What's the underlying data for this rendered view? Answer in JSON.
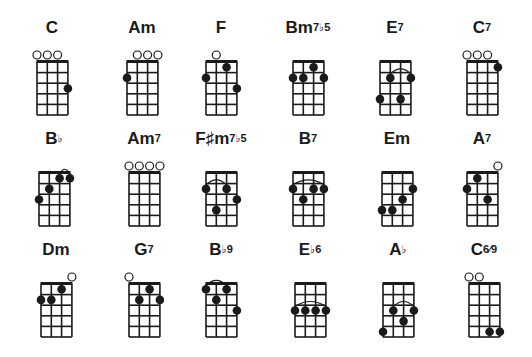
{
  "layout": {
    "strings": 4,
    "frets": 5
  },
  "chords": [
    {
      "name": "C",
      "sup": "",
      "x": 37,
      "y": 62,
      "open": [
        0,
        1,
        2
      ],
      "dots": [
        {
          "s": 3,
          "f": 3
        }
      ],
      "arcs": []
    },
    {
      "name": "Am",
      "sup": "",
      "x": 127,
      "y": 62,
      "open": [
        1,
        2,
        3
      ],
      "dots": [
        {
          "s": 0,
          "f": 2
        }
      ],
      "arcs": []
    },
    {
      "name": "F",
      "sup": "",
      "x": 206,
      "y": 62,
      "open": [
        1
      ],
      "dots": [
        {
          "s": 0,
          "f": 2
        },
        {
          "s": 2,
          "f": 1
        },
        {
          "s": 3,
          "f": 3
        }
      ],
      "arcs": []
    },
    {
      "name": "Bm",
      "sup": "7♭5",
      "x": 293,
      "y": 62,
      "open": [],
      "dots": [
        {
          "s": 0,
          "f": 2
        },
        {
          "s": 1,
          "f": 2
        },
        {
          "s": 2,
          "f": 1
        },
        {
          "s": 3,
          "f": 2
        }
      ],
      "arcs": []
    },
    {
      "name": "E",
      "sup": "7",
      "x": 380,
      "y": 62,
      "open": [],
      "dots": [
        {
          "s": 1,
          "f": 2
        },
        {
          "s": 3,
          "f": 2
        },
        {
          "s": 0,
          "f": 4
        },
        {
          "s": 2,
          "f": 4
        }
      ],
      "arcs": [
        {
          "from": 1,
          "to": 3,
          "f": 2
        }
      ]
    },
    {
      "name": "C",
      "sup": "7",
      "x": 467,
      "y": 62,
      "open": [
        0,
        1,
        2
      ],
      "dots": [
        {
          "s": 3,
          "f": 1
        }
      ],
      "arcs": []
    },
    {
      "name": "B",
      "sup": "♭",
      "x": 39,
      "y": 173,
      "open": [],
      "dots": [
        {
          "s": 0,
          "f": 3
        },
        {
          "s": 1,
          "f": 2
        },
        {
          "s": 2,
          "f": 1
        },
        {
          "s": 3,
          "f": 1
        }
      ],
      "arcs": [
        {
          "from": 2,
          "to": 3,
          "f": 1
        }
      ]
    },
    {
      "name": "Am",
      "sup": "7",
      "x": 129,
      "y": 173,
      "open": [
        0,
        1,
        2,
        3
      ],
      "dots": [],
      "arcs": []
    },
    {
      "name": "F♯m",
      "sup": "7♭5",
      "x": 206,
      "y": 173,
      "open": [],
      "dots": [
        {
          "s": 0,
          "f": 2
        },
        {
          "s": 2,
          "f": 2
        },
        {
          "s": 3,
          "f": 3
        },
        {
          "s": 1,
          "f": 4
        }
      ],
      "arcs": [
        {
          "from": 0,
          "to": 2,
          "f": 2
        }
      ]
    },
    {
      "name": "B",
      "sup": "7",
      "x": 293,
      "y": 173,
      "open": [],
      "dots": [
        {
          "s": 0,
          "f": 2
        },
        {
          "s": 2,
          "f": 2
        },
        {
          "s": 3,
          "f": 2
        },
        {
          "s": 1,
          "f": 3
        }
      ],
      "arcs": [
        {
          "from": 0,
          "to": 3,
          "f": 2
        }
      ]
    },
    {
      "name": "Em",
      "sup": "",
      "x": 382,
      "y": 173,
      "open": [],
      "dots": [
        {
          "s": 3,
          "f": 2
        },
        {
          "s": 2,
          "f": 3
        },
        {
          "s": 0,
          "f": 4
        },
        {
          "s": 1,
          "f": 4
        }
      ],
      "arcs": []
    },
    {
      "name": "A",
      "sup": "7",
      "x": 467,
      "y": 173,
      "open": [
        3
      ],
      "dots": [
        {
          "s": 1,
          "f": 1
        },
        {
          "s": 0,
          "f": 2
        },
        {
          "s": 2,
          "f": 3
        }
      ],
      "arcs": []
    },
    {
      "name": "Dm",
      "sup": "",
      "x": 41,
      "y": 284,
      "open": [
        3
      ],
      "dots": [
        {
          "s": 0,
          "f": 2
        },
        {
          "s": 1,
          "f": 2
        },
        {
          "s": 2,
          "f": 1
        }
      ],
      "arcs": []
    },
    {
      "name": "G",
      "sup": "7",
      "x": 129,
      "y": 284,
      "open": [
        0
      ],
      "dots": [
        {
          "s": 1,
          "f": 2
        },
        {
          "s": 2,
          "f": 1
        },
        {
          "s": 3,
          "f": 2
        }
      ],
      "arcs": []
    },
    {
      "name": "B",
      "sup": "♭9",
      "x": 206,
      "y": 284,
      "open": [],
      "dots": [
        {
          "s": 0,
          "f": 1
        },
        {
          "s": 2,
          "f": 1
        },
        {
          "s": 1,
          "f": 2
        },
        {
          "s": 3,
          "f": 3
        }
      ],
      "arcs": [
        {
          "from": 0,
          "to": 2,
          "f": 1
        }
      ]
    },
    {
      "name": "E",
      "sup": "♭6",
      "x": 295,
      "y": 284,
      "open": [],
      "dots": [
        {
          "s": 0,
          "f": 3
        },
        {
          "s": 1,
          "f": 3
        },
        {
          "s": 2,
          "f": 3
        },
        {
          "s": 3,
          "f": 3
        }
      ],
      "arcs": [
        {
          "from": 0,
          "to": 3,
          "f": 3
        }
      ]
    },
    {
      "name": "A",
      "sup": "♭",
      "x": 383,
      "y": 284,
      "open": [],
      "dots": [
        {
          "s": 1,
          "f": 3
        },
        {
          "s": 3,
          "f": 3
        },
        {
          "s": 2,
          "f": 4
        },
        {
          "s": 0,
          "f": 5
        }
      ],
      "arcs": [
        {
          "from": 1,
          "to": 3,
          "f": 3
        }
      ]
    },
    {
      "name": "C",
      "sup": "6⁄9",
      "x": 469,
      "y": 284,
      "open": [
        0,
        1
      ],
      "dots": [
        {
          "s": 2,
          "f": 5
        },
        {
          "s": 3,
          "f": 5
        }
      ],
      "arcs": []
    }
  ]
}
